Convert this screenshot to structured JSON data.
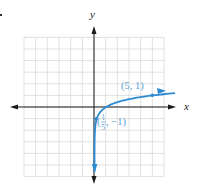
{
  "chart_data": {
    "type": "line",
    "title": "",
    "function": "y = log_5(x)",
    "xlabel": "x",
    "ylabel": "y",
    "xlim": [
      -6,
      6
    ],
    "ylim": [
      -6,
      6
    ],
    "grid": true,
    "grid_step": 1,
    "series": [
      {
        "name": "y = log5(x)",
        "color": "#2e8bd1",
        "x": [
          0.0001,
          0.008,
          0.04,
          0.2,
          0.5,
          1,
          2,
          3,
          4,
          5,
          6
        ],
        "y": [
          -5.72,
          -3,
          -2,
          -1,
          -0.43,
          0,
          0.43,
          0.68,
          0.86,
          1,
          1.11
        ]
      }
    ],
    "annotations": [
      {
        "text": "(5, 1)",
        "point": [
          5,
          1
        ]
      },
      {
        "text": "(1/5, −1)",
        "point": [
          0.2,
          -1
        ],
        "numerator": "1",
        "denominator": "5",
        "rest": ", −1)"
      }
    ],
    "legend": null
  },
  "labels": {
    "x_axis": "x",
    "y_axis": "y",
    "point_a": "(5, 1)",
    "point_b_open": "(",
    "point_b_num": "1",
    "point_b_den": "5",
    "point_b_rest": ", −1)"
  },
  "colors": {
    "curve": "#2e8bd1",
    "label": "#5a9fd4",
    "axis": "#1a1a1a",
    "grid": "#d9d9d9"
  }
}
